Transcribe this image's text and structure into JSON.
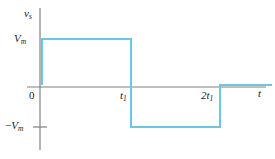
{
  "figure": {
    "name": "square-wave-voltage-source-plot",
    "background_color": "#ffffff"
  },
  "colors": {
    "trace": "#6ec6e6",
    "axis": "#808080",
    "text": "#1a1a1a"
  },
  "axes": {
    "y_axis_label": "v",
    "y_axis_label_sub": "s",
    "x_axis_label": "t",
    "y_ticks": [
      {
        "label": "V",
        "sub": "m",
        "sign": ""
      },
      {
        "label": "V",
        "sub": "m",
        "sign": "−"
      }
    ],
    "x_ticks": [
      {
        "label": "0",
        "sub": ""
      },
      {
        "label": "t",
        "sub": "1"
      },
      {
        "label": "2t",
        "sub": "1"
      }
    ]
  },
  "labels": {
    "vs": "v",
    "vs_sub": "s",
    "t": "t",
    "vm": "V",
    "vm_sub": "m",
    "neg_vm_sign": "−",
    "neg_vm": "V",
    "neg_vm_sub": "m",
    "zero": "0",
    "t1": "t",
    "t1_sub": "1",
    "two_t1": "2t",
    "two_t1_sub": "1"
  },
  "chart_data": {
    "type": "line",
    "title": "",
    "subtitle": "",
    "xlabel": "t",
    "ylabel": "v_s",
    "grid": false,
    "legend": null,
    "xlim": [
      -0.2,
      3.2
    ],
    "ylim": [
      -1.6,
      1.6
    ],
    "x_tick_values": [
      0,
      1,
      2
    ],
    "x_tick_labels": [
      "0",
      "t1",
      "2t1"
    ],
    "y_tick_values": [
      1,
      -1
    ],
    "y_tick_labels": [
      "Vm",
      "-Vm"
    ],
    "series": [
      {
        "name": "v_s(t)",
        "color": "#6ec6e6",
        "x": [
          0,
          0,
          1,
          1,
          2,
          2,
          3.2
        ],
        "values": [
          0,
          1,
          1,
          -1,
          -1,
          0,
          0
        ]
      }
    ],
    "segments": [
      {
        "t_start": 0,
        "t_end": 1,
        "level": 1,
        "level_label": "Vm"
      },
      {
        "t_start": 1,
        "t_end": 2,
        "level": -1,
        "level_label": "-Vm"
      },
      {
        "t_start": 2,
        "t_end": 3.2,
        "level": 0,
        "level_label": "0"
      }
    ]
  },
  "geometry": {
    "y_axis_x": 40,
    "y_axis_top": 8,
    "y_axis_bottom": 150,
    "x_axis_y": 87,
    "x_axis_left": 27,
    "x_axis_right": 266,
    "level_pos_y": 39,
    "level_zero_y": 85,
    "level_neg_y": 127,
    "edge_t0_x": 42,
    "edge_t1_x": 131,
    "edge_2t1_x": 219,
    "trace_right_x": 272,
    "neg_tick_x_start": 33,
    "neg_tick_x_end": 47
  }
}
